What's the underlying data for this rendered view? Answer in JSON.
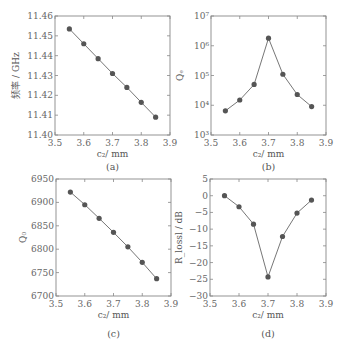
{
  "chart_data": [
    {
      "id": "a",
      "type": "line",
      "caption": "(a)",
      "xlabel": "c₂/ mm",
      "ylabel": "频率 / GHz",
      "x": [
        3.55,
        3.6,
        3.65,
        3.7,
        3.75,
        3.8,
        3.85
      ],
      "series": [
        {
          "name": "frequency",
          "values": [
            11.4535,
            11.446,
            11.4385,
            11.431,
            11.424,
            11.4165,
            11.409
          ]
        }
      ],
      "xlim": [
        3.5,
        3.9
      ],
      "ylim": [
        11.4,
        11.46
      ],
      "yscale": "linear",
      "xticks": [
        "3.5",
        "3.6",
        "3.7",
        "3.8",
        "3.9"
      ],
      "yticks": [
        "11.40",
        "11.41",
        "11.42",
        "11.43",
        "11.44",
        "11.45",
        "11.46"
      ],
      "grid": false
    },
    {
      "id": "b",
      "type": "line",
      "caption": "(b)",
      "xlabel": "c₂/ mm",
      "ylabel": "Qₑ",
      "x": [
        3.55,
        3.6,
        3.65,
        3.7,
        3.75,
        3.8,
        3.85
      ],
      "series": [
        {
          "name": "Qe",
          "values": [
            6500,
            15000,
            50000,
            1800000,
            110000,
            23000,
            9000
          ]
        }
      ],
      "xlim": [
        3.5,
        3.9
      ],
      "ylim": [
        1000,
        10000000
      ],
      "yscale": "log",
      "xticks": [
        "3.5",
        "3.6",
        "3.7",
        "3.8",
        "3.9"
      ],
      "yticks": [
        "10³",
        "10⁴",
        "10⁵",
        "10⁶",
        "10⁷"
      ],
      "grid": false
    },
    {
      "id": "c",
      "type": "line",
      "caption": "(c)",
      "xlabel": "c₂/ mm",
      "ylabel": "Q₀",
      "x": [
        3.55,
        3.6,
        3.65,
        3.7,
        3.75,
        3.8,
        3.85
      ],
      "series": [
        {
          "name": "Q0",
          "values": [
            6922,
            6895,
            6866,
            6836,
            6805,
            6772,
            6737
          ]
        }
      ],
      "xlim": [
        3.5,
        3.9
      ],
      "ylim": [
        6700,
        6950
      ],
      "yscale": "linear",
      "xticks": [
        "3.5",
        "3.6",
        "3.7",
        "3.8",
        "3.9"
      ],
      "yticks": [
        "6700",
        "6750",
        "6800",
        "6850",
        "6900",
        "6950"
      ],
      "grid": false
    },
    {
      "id": "d",
      "type": "line",
      "caption": "(d)",
      "xlabel": "c₂/ mm",
      "ylabel": "R_lossl / dB",
      "x": [
        3.55,
        3.6,
        3.65,
        3.7,
        3.75,
        3.8,
        3.85
      ],
      "series": [
        {
          "name": "R",
          "values": [
            0,
            -3.3,
            -8.5,
            -24.3,
            -12.2,
            -5.2,
            -1.3
          ]
        }
      ],
      "xlim": [
        3.5,
        3.9
      ],
      "ylim": [
        -30,
        5
      ],
      "yscale": "linear",
      "xticks": [
        "3.5",
        "3.6",
        "3.7",
        "3.8",
        "3.9"
      ],
      "yticks": [
        "−30",
        "−25",
        "−20",
        "−15",
        "−10",
        "−5",
        "0",
        "5"
      ],
      "grid": false
    }
  ]
}
